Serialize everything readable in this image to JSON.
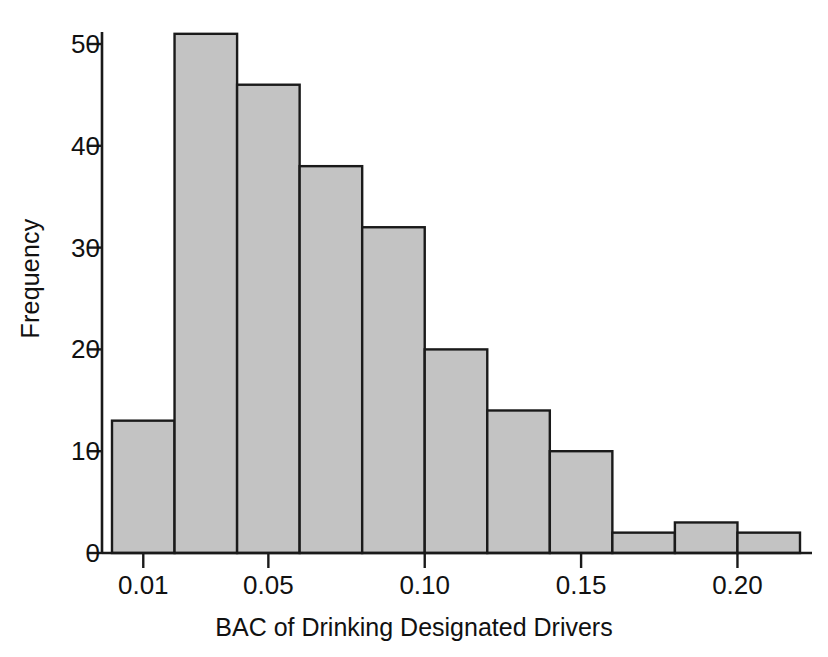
{
  "chart_data": {
    "type": "bar",
    "title": "",
    "subtitle": "",
    "xlabel": "BAC of Drinking Designated Drivers",
    "ylabel": "Frequency",
    "bin_width": 0.02,
    "bin_starts": [
      0.0,
      0.02,
      0.04,
      0.06,
      0.08,
      0.1,
      0.12,
      0.14,
      0.16,
      0.18,
      0.2
    ],
    "bin_ends": [
      0.02,
      0.04,
      0.06,
      0.08,
      0.1,
      0.12,
      0.14,
      0.16,
      0.18,
      0.2,
      0.22
    ],
    "categories": [
      "0.00-0.02",
      "0.02-0.04",
      "0.04-0.06",
      "0.06-0.08",
      "0.08-0.10",
      "0.10-0.12",
      "0.12-0.14",
      "0.14-0.16",
      "0.16-0.18",
      "0.18-0.20",
      "0.20-0.22"
    ],
    "values": [
      13,
      51,
      46,
      38,
      32,
      20,
      14,
      10,
      2,
      3,
      2
    ],
    "xtick_values": [
      0.01,
      0.05,
      0.1,
      0.15,
      0.2
    ],
    "xtick_labels": [
      "0.01",
      "0.05",
      "0.10",
      "0.15",
      "0.20"
    ],
    "ytick_values": [
      0,
      10,
      20,
      30,
      40,
      50
    ],
    "ytick_labels": [
      "0",
      "10",
      "20",
      "30",
      "40",
      "50"
    ],
    "ylim": [
      0,
      53
    ],
    "xlim": [
      -0.0005,
      0.2195
    ],
    "grid": false,
    "legend": null,
    "bar_fill_color": "#c3c3c3",
    "bar_edge_color": "#1a1a1a",
    "axis_color": "#1a1a1a",
    "background_color": "#ffffff"
  },
  "axes": {
    "ylabel": "Frequency",
    "xlabel": "BAC of Drinking Designated Drivers"
  }
}
